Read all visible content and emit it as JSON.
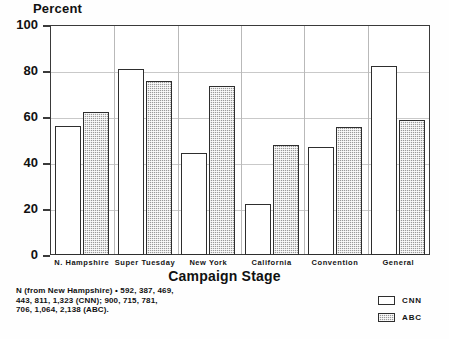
{
  "chart_data": {
    "type": "bar",
    "title": "",
    "ylabel": "Percent",
    "xlabel": "Campaign Stage",
    "ylim": [
      0,
      100
    ],
    "yticks": [
      0,
      20,
      40,
      60,
      80,
      100
    ],
    "grid": true,
    "legend_position": "bottom-right",
    "categories": [
      "N. Hampshire",
      "Super Tuesday",
      "New York",
      "California",
      "Convention",
      "General"
    ],
    "series": [
      {
        "name": "CNN",
        "color": "#ffffff",
        "values": [
          56,
          81,
          44.5,
          22,
          47,
          82
        ]
      },
      {
        "name": "ABC",
        "color": "#9a9a9a",
        "values": [
          62,
          75.5,
          73.5,
          48,
          55.5,
          58.5
        ]
      }
    ],
    "annotations": [
      "N (from New Hampshire) • 592, 387, 469,",
      "443, 811, 1,323 (CNN); 900, 715, 781,",
      "706, 1,064, 2,138 (ABC)."
    ]
  },
  "legend": {
    "items": [
      {
        "label": "CNN"
      },
      {
        "label": "ABC"
      }
    ]
  }
}
